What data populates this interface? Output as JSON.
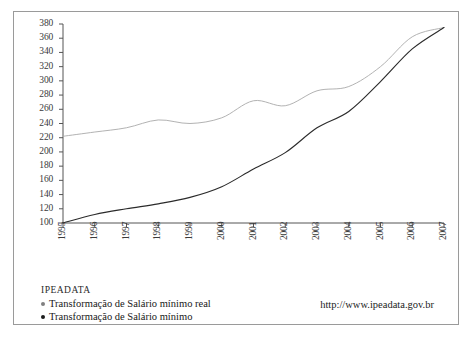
{
  "chart_data": {
    "type": "line",
    "title": "",
    "subtitle": "",
    "xlabel": "",
    "ylabel": "",
    "grid": false,
    "legend_position": "bottom-left",
    "source_label": "IPEADATA",
    "source_url": "http://www.ipeadata.gov.br",
    "x": [
      1995,
      1996,
      1997,
      1998,
      1999,
      2000,
      2001,
      2002,
      2003,
      2004,
      2005,
      2006,
      2007
    ],
    "xlim": [
      1995,
      2007
    ],
    "ylim": [
      100,
      380
    ],
    "xticks": [
      "1995",
      "1996",
      "1997",
      "1998",
      "1999",
      "2000",
      "2001",
      "2002",
      "2003",
      "2004",
      "2005",
      "2006",
      "2007"
    ],
    "yticks": [
      100,
      120,
      140,
      160,
      180,
      200,
      220,
      240,
      260,
      280,
      300,
      320,
      340,
      360,
      380
    ],
    "series": [
      {
        "name": "Transformação de Salário mínimo real",
        "color": "#a9a9a9",
        "values": [
          222,
          228,
          234,
          245,
          240,
          248,
          272,
          265,
          286,
          292,
          320,
          362,
          375
        ]
      },
      {
        "name": "Transformação de Salário mínimo",
        "color": "#2b2b2b",
        "values": [
          100,
          112,
          120,
          127,
          136,
          151,
          176,
          199,
          234,
          257,
          299,
          345,
          375
        ]
      }
    ],
    "annotations": []
  },
  "legend": {
    "title": "IPEADATA",
    "items": [
      {
        "label": "Transformação de Salário mínimo real",
        "color": "#808080"
      },
      {
        "label": "Transformação de Salário mínimo",
        "color": "#1c1c1c"
      }
    ]
  },
  "footer": {
    "url": "http://www.ipeadata.gov.br"
  }
}
